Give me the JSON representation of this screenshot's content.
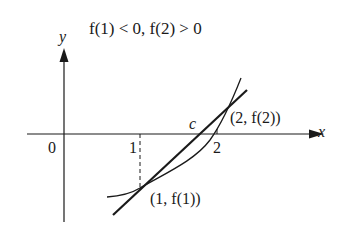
{
  "title": "f(1) < 0, f(2) > 0",
  "axes": {
    "x_label": "x",
    "y_label": "y",
    "origin_label": "0",
    "x_ticks": [
      "1",
      "2"
    ]
  },
  "annotations": {
    "root_label": "c",
    "point_a": "(1, f(1))",
    "point_b": "(2, f(2))"
  },
  "colors": {
    "stroke": "#1a1a1a",
    "background": "#ffffff"
  }
}
